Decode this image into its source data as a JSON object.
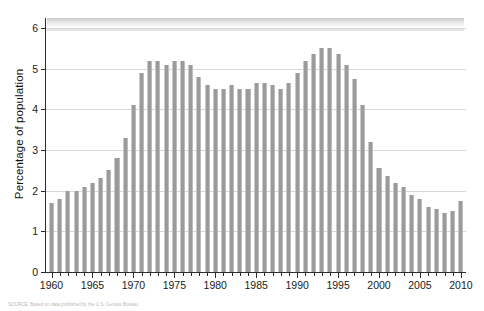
{
  "chart_data": {
    "type": "bar",
    "title": "",
    "xlabel": "",
    "ylabel": "Percentage of population",
    "ylim": [
      0,
      6.3
    ],
    "xlim": [
      1959.3,
      2010.7
    ],
    "yticks": [
      0,
      1,
      2,
      3,
      4,
      5,
      6
    ],
    "ytick_labels": [
      "0",
      "1",
      "2",
      "3",
      "4",
      "5",
      "6"
    ],
    "xticks": [
      1960,
      1965,
      1970,
      1975,
      1980,
      1985,
      1990,
      1995,
      2000,
      2005,
      2010
    ],
    "xtick_labels": [
      "1960",
      "1965",
      "1970",
      "1975",
      "1980",
      "1985",
      "1990",
      "1995",
      "2000",
      "2005",
      "2010"
    ],
    "grid": "horizontal",
    "legend": "none",
    "bar_color": "#9b9b9b",
    "categories": [
      1960,
      1961,
      1962,
      1963,
      1964,
      1965,
      1966,
      1967,
      1968,
      1969,
      1970,
      1971,
      1972,
      1973,
      1974,
      1975,
      1976,
      1977,
      1978,
      1979,
      1980,
      1981,
      1982,
      1983,
      1984,
      1985,
      1986,
      1987,
      1988,
      1989,
      1990,
      1991,
      1992,
      1993,
      1994,
      1995,
      1996,
      1997,
      1998,
      1999,
      2000,
      2001,
      2002,
      2003,
      2004,
      2005,
      2006,
      2007,
      2008,
      2009,
      2010
    ],
    "values": [
      1.7,
      1.8,
      2.0,
      2.0,
      2.1,
      2.2,
      2.3,
      2.5,
      2.8,
      3.3,
      4.1,
      4.9,
      5.2,
      5.2,
      5.1,
      5.2,
      5.2,
      5.1,
      4.8,
      4.6,
      4.5,
      4.5,
      4.6,
      4.5,
      4.5,
      4.65,
      4.65,
      4.6,
      4.5,
      4.65,
      4.9,
      5.2,
      5.35,
      5.5,
      5.5,
      5.35,
      5.1,
      4.75,
      4.1,
      3.2,
      2.55,
      2.35,
      2.2,
      2.1,
      1.9,
      1.8,
      1.6,
      1.55,
      1.45,
      1.5,
      1.75
    ]
  },
  "caption": {
    "source_note": "SOURCE: Based on data published by the U.S. Census Bureau."
  }
}
